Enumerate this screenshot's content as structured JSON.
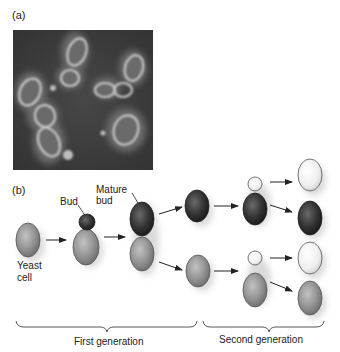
{
  "figure": {
    "panel_a": {
      "label": "(a)",
      "description": "Micrograph of budding yeast cells"
    },
    "panel_b": {
      "label": "(b)",
      "labels": {
        "yeast_cell_line1": "Yeast",
        "yeast_cell_line2": "cell",
        "bud": "Bud",
        "mature_bud_line1": "Mature",
        "mature_bud_line2": "bud"
      },
      "generations": {
        "first": "First generation",
        "second": "Second generation"
      }
    },
    "colors": {
      "dark_cell": "#2e2e2e",
      "mid_cell": "#8f8f8f",
      "light_cell": "#ececec",
      "micrograph_bg": "#3c3c3c"
    }
  }
}
